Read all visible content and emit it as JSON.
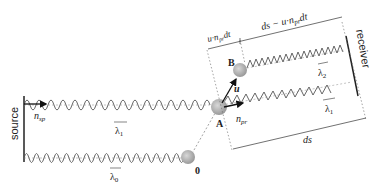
{
  "diagram": {
    "labels": {
      "source": "source",
      "receiver": "receiver",
      "n_sp": "n",
      "n_sp_sub": "sp",
      "n_pr": "n",
      "n_pr_sub": "pr",
      "u": "u",
      "point_A": "A",
      "point_B": "B",
      "point_0": "0",
      "lambda0": "λ",
      "lambda0_sub": "0",
      "lambda1_left": "λ",
      "lambda1_left_sub": "1",
      "lambda1_right": "λ",
      "lambda1_right_sub": "1",
      "lambda2": "λ",
      "lambda2_sub": "2",
      "ds_bottom": "ds",
      "top_left_dim": "u·n",
      "top_left_dim_sub": "pr",
      "top_left_dim_tail": "dt",
      "top_right_dim": "ds − u·n",
      "top_right_dim_sub": "pr",
      "top_right_dim_tail": "dt"
    },
    "colors": {
      "wave": "#555555",
      "particle": "#b0b0b0",
      "line": "#333333",
      "arrow": "#111111"
    }
  }
}
